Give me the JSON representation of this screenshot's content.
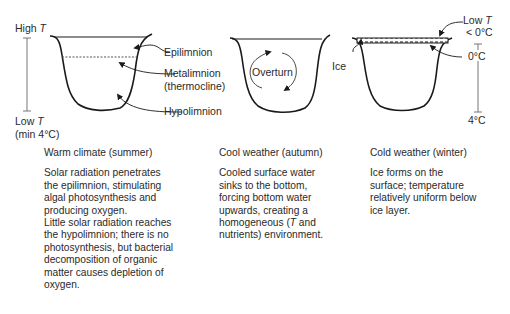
{
  "panels": [
    {
      "id": "summer",
      "labels": {
        "high_t_prefix": "High ",
        "high_t_var": "T",
        "low_t_prefix": "Low ",
        "low_t_var": "T",
        "low_t_note": "(min 4°C)",
        "epilimnion": "Epilimnion",
        "metalimnion": "Metalimnion",
        "thermocline": "(thermocline)",
        "hypolimnion": "Hypolimnion"
      },
      "title": "Warm climate (summer)",
      "body": "Solar radiation penetrates\nthe epilimnion, stimulating\nalgal photosynthesis and\nproducing oxygen.\nLittle solar radiation reaches\nthe hypolimnion; there is no\nphotosynthesis, but bacterial\ndecomposition of organic\nmatter causes depletion of\noxygen."
    },
    {
      "id": "autumn",
      "labels": {
        "overturn": "Overturn"
      },
      "title": "Cool weather (autumn)",
      "body_pre": "Cooled surface water\nsinks to the bottom,\nforcing bottom water\nupwards, creating a\nhomogeneous (",
      "body_var": "T",
      "body_post": " and\nnutrients) environment."
    },
    {
      "id": "winter",
      "labels": {
        "ice": "Ice",
        "low_t_prefix": "Low ",
        "low_t_var": "T",
        "below_zero": "< 0°C",
        "zero": "0°C",
        "four": "4°C"
      },
      "title": "Cold weather (winter)",
      "body": "Ice forms on the\nsurface; temperature\nrelatively uniform below\nice layer."
    }
  ],
  "colors": {
    "line": "#1a1a1a",
    "text": "#2a2a2a",
    "scale": "#777777"
  }
}
